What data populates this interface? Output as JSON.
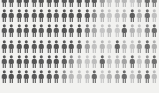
{
  "chart_data": {
    "type": "pictogram",
    "title": "",
    "subtitle": "",
    "xlabel": "",
    "ylabel": "",
    "icon": "person-icon",
    "columns": 21,
    "rows": 6,
    "total_icons": 126,
    "background_color": "#f2f2f0",
    "legend": [],
    "annotations": [],
    "grid": false,
    "categories": [
      "col-1",
      "col-2",
      "col-3",
      "col-4",
      "col-5",
      "col-6",
      "col-7",
      "col-8",
      "col-9",
      "col-10",
      "col-11",
      "col-12",
      "col-13",
      "col-14",
      "col-15",
      "col-16",
      "col-17",
      "col-18",
      "col-19",
      "col-20",
      "col-21"
    ],
    "palette": {
      "darkest": "#4a4a4a",
      "dark": "#5a5a5a",
      "mid_dark": "#6e6e6e",
      "mid": "#8e8e8e",
      "mid_light": "#aaaaaa",
      "light": "#c4c4c4",
      "lightest": "#d8d8d8"
    },
    "icon_colors": [
      [
        "#555555",
        "#5a5a5a",
        "#575757",
        "#525252",
        "#5c5c5c",
        "#555555",
        "#585858",
        "#535353",
        "#5a5a5a",
        "#565656",
        "#545454",
        "#5e5e5e",
        "#585858",
        "#9a9a9a",
        "#c2c2c2",
        "#bdbdbd",
        "#b5b5b5",
        "#c8c8c8",
        "#a8a8a8",
        "#6a6a6a",
        "#7a7a7a"
      ],
      [
        "#525252",
        "#585858",
        "#565656",
        "#545454",
        "#5a5a5a",
        "#535353",
        "#575757",
        "#5b5b5b",
        "#545454",
        "#585858",
        "#565656",
        "#5a5a5a",
        "#8a8a8a",
        "#b0b0b0",
        "#c6c6c6",
        "#bfbfbf",
        "#b8b8b8",
        "#5e5e5e",
        "#aeaeae",
        "#6e6e6e",
        "#c0c0c0"
      ],
      [
        "#585858",
        "#545454",
        "#5a5a5a",
        "#575757",
        "#525252",
        "#5c5c5c",
        "#555555",
        "#595959",
        "#535353",
        "#5b5b5b",
        "#565656",
        "#7e7e7e",
        "#a6a6a6",
        "#c4c4c4",
        "#bababa",
        "#c8c8c8",
        "#606060",
        "#b4b4b4",
        "#c2c2c2",
        "#8a8a8a",
        "#6c6c6c"
      ],
      [
        "#545454",
        "#5a5a5a",
        "#565656",
        "#525252",
        "#585858",
        "#575757",
        "#5c5c5c",
        "#545454",
        "#5a5a5a",
        "#565656",
        "#6a6a6a",
        "#a0a0a0",
        "#c0c0c0",
        "#b6b6b6",
        "#cacaca",
        "#646464",
        "#b8b8b8",
        "#c4c4c4",
        "#9c9c9c",
        "#6e6e6e",
        "#b0b0b0"
      ],
      [
        "#5a5a5a",
        "#565656",
        "#525252",
        "#585858",
        "#545454",
        "#5b5b5b",
        "#575757",
        "#535353",
        "#5e5e5e",
        "#8c8c8c",
        "#b4b4b4",
        "#c6c6c6",
        "#bcbcbc",
        "#666666",
        "#c0c0c0",
        "#bababa",
        "#a2a2a2",
        "#6a6a6a",
        "#c4c4c4",
        "#989898",
        "#707070"
      ],
      [
        "#565656",
        "#525252",
        "#585858",
        "#545454",
        "#5a5a5a",
        "#575757",
        "#5c5c5c",
        "#606060",
        "#8e8e8e",
        "#b8b8b8",
        "#c2c2c2",
        "#bebebe",
        "#686868",
        "#c6c6c6",
        "#b2b2b2",
        "#a4a4a4",
        "#6c6c6c",
        "#c0c0c0",
        "#9a9a9a",
        "#727272",
        "#bcbcbc"
      ]
    ]
  }
}
